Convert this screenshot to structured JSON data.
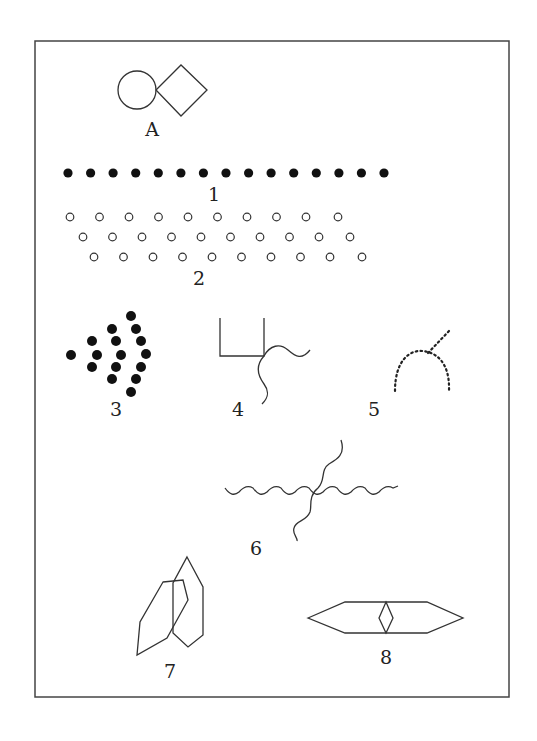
{
  "figure": {
    "frame": {
      "x": 35,
      "y": 41,
      "width": 474,
      "height": 656,
      "color": "#444444"
    },
    "ink_color": "#333333",
    "items": [
      {
        "id": "A",
        "label": "A",
        "description": "circle touching a diamond (square rotated 45°)"
      },
      {
        "id": "1",
        "label": "1",
        "description": "single row of 15 filled dots"
      },
      {
        "id": "2",
        "label": "2",
        "description": "three staggered rows of 10 open circles each"
      },
      {
        "id": "3",
        "label": "3",
        "description": "filled dots arranged in nested chevron arcs (1, 3, 5, 7)"
      },
      {
        "id": "4",
        "label": "4",
        "description": "U-shaped bracket with two wavy lines emanating from right corner"
      },
      {
        "id": "5",
        "label": "5",
        "description": "dotted arch with dotted diagonal branch"
      },
      {
        "id": "6",
        "label": "6",
        "description": "horizontal wavy line crossed by a diagonal wavy line"
      },
      {
        "id": "7",
        "label": "7",
        "description": "two overlapping hexagonal shapes"
      },
      {
        "id": "8",
        "label": "8",
        "description": "elongated hexagon with small diamond in center"
      }
    ]
  }
}
